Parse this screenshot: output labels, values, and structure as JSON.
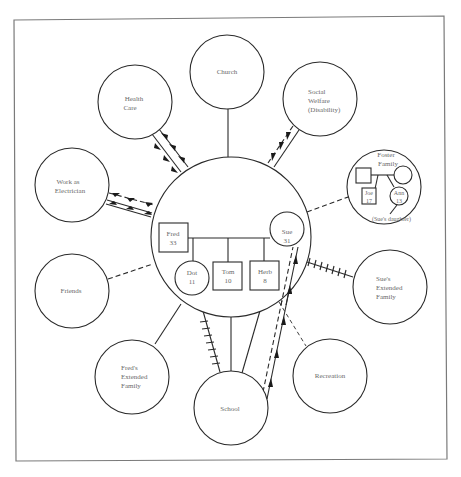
{
  "diagram": {
    "type": "ecomap",
    "frame": {
      "x": 14,
      "y": 18,
      "width": 433,
      "height": 441
    },
    "family": {
      "label": "Household",
      "center": [
        231,
        237
      ],
      "radius": 80,
      "members": [
        {
          "id": "fred",
          "name": "Fred",
          "age": "33",
          "shape": "square"
        },
        {
          "id": "sue",
          "name": "Sue",
          "age": "31",
          "shape": "circle"
        },
        {
          "id": "dot",
          "name": "Dot",
          "age": "11",
          "shape": "circle"
        },
        {
          "id": "tom",
          "name": "Tom",
          "age": "10",
          "shape": "square"
        },
        {
          "id": "herb",
          "name": "Herb",
          "age": "8",
          "shape": "square"
        }
      ]
    },
    "systems": [
      {
        "id": "church",
        "lines": [
          "Church"
        ]
      },
      {
        "id": "health-care",
        "lines": [
          "Health",
          "Care"
        ]
      },
      {
        "id": "social-welfare",
        "lines": [
          "Social",
          "Welfare",
          "(Disability)"
        ]
      },
      {
        "id": "work",
        "lines": [
          "Work as",
          "Electrician"
        ]
      },
      {
        "id": "foster-family",
        "lines": [
          "Foster",
          "Family"
        ]
      },
      {
        "id": "friends",
        "lines": [
          "Friends"
        ]
      },
      {
        "id": "sues-extended-family",
        "lines": [
          "Sue's",
          "Extended",
          "Family"
        ]
      },
      {
        "id": "freds-extended-family",
        "lines": [
          "Fred's",
          "Extended",
          "Family"
        ]
      },
      {
        "id": "school",
        "lines": [
          "School"
        ]
      },
      {
        "id": "recreation",
        "lines": [
          "Recreation"
        ]
      }
    ],
    "foster_family": {
      "members": [
        {
          "id": "joe",
          "name": "Joe",
          "age": "17",
          "shape": "square"
        },
        {
          "id": "ann",
          "name": "Ann",
          "age": "13",
          "shape": "circle"
        }
      ],
      "note": "(Sue's daughter)"
    },
    "connections": [
      {
        "from": "church",
        "to": "family",
        "style": "solid"
      },
      {
        "from": "health-care",
        "to": "family",
        "style": "double-solid",
        "flow": "both"
      },
      {
        "from": "social-welfare",
        "to": "family",
        "style": "dashed+solid",
        "flow": "to-family"
      },
      {
        "from": "work",
        "to": "family",
        "style": "dashed+solid",
        "flow": "both"
      },
      {
        "from": "foster-family",
        "to": "family",
        "style": "dashed"
      },
      {
        "from": "friends",
        "to": "family",
        "style": "dashed"
      },
      {
        "from": "sues-extended-family",
        "to": "family",
        "style": "stressful"
      },
      {
        "from": "freds-extended-family",
        "to": "family",
        "style": "solid"
      },
      {
        "from": "school",
        "to": "dot",
        "style": "stressful"
      },
      {
        "from": "school",
        "to": "tom",
        "style": "solid"
      },
      {
        "from": "school",
        "to": "herb",
        "style": "solid"
      },
      {
        "from": "school",
        "to": "sue",
        "style": "dashed+solid",
        "flow": "to-sue"
      },
      {
        "from": "recreation",
        "to": "family",
        "style": "dashed"
      }
    ]
  }
}
